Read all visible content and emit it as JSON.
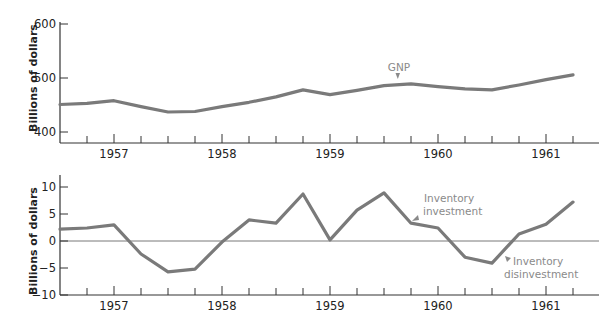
{
  "chart_data": [
    {
      "type": "line",
      "title": "",
      "xlabel": "",
      "ylabel": "Billions of dollars",
      "ylim": [
        380,
        600
      ],
      "yticks": [
        400,
        500,
        600
      ],
      "ytick_labels": [
        "400",
        "500",
        "600"
      ],
      "x_tick_labels": [
        "1957",
        "1958",
        "1959",
        "1960",
        "1961"
      ],
      "x_quarterly_ticks": true,
      "grid": false,
      "series": [
        {
          "name": "GNP",
          "color": "#7a7a7a",
          "x": [
            1956.5,
            1956.75,
            1957.0,
            1957.25,
            1957.5,
            1957.75,
            1958.0,
            1958.25,
            1958.5,
            1958.75,
            1959.0,
            1959.25,
            1959.5,
            1959.75,
            1960.0,
            1960.25,
            1960.5,
            1960.75,
            1961.0,
            1961.25
          ],
          "values": [
            451,
            453,
            458,
            447,
            437,
            438,
            447,
            455,
            465,
            478,
            469,
            477,
            486,
            489,
            484,
            480,
            478,
            487,
            497,
            506
          ]
        }
      ],
      "annotations": [
        {
          "text": "GNP",
          "x": 1959.65,
          "y": 489
        }
      ]
    },
    {
      "type": "line",
      "title": "",
      "xlabel": "",
      "ylabel": "Billions of dollars",
      "ylim": [
        -10,
        12
      ],
      "yticks": [
        -10,
        -5,
        0,
        5,
        10
      ],
      "ytick_labels": [
        "−10",
        "−5",
        "0",
        "5",
        "10"
      ],
      "x_tick_labels": [
        "1957",
        "1958",
        "1959",
        "1960",
        "1961"
      ],
      "x_quarterly_ticks": true,
      "zero_line": true,
      "grid": false,
      "series": [
        {
          "name": "Inventory investment",
          "color": "#7a7a7a",
          "x": [
            1956.5,
            1956.75,
            1957.0,
            1957.25,
            1957.5,
            1957.75,
            1958.0,
            1958.25,
            1958.5,
            1958.75,
            1959.0,
            1959.25,
            1959.5,
            1959.75,
            1960.0,
            1960.25,
            1960.5,
            1960.75,
            1961.0,
            1961.25
          ],
          "values": [
            2.2,
            2.4,
            3.0,
            -2.4,
            -5.7,
            -5.2,
            -0.2,
            3.9,
            3.3,
            8.7,
            0.2,
            5.7,
            8.9,
            3.3,
            2.4,
            -3.0,
            -4.1,
            1.3,
            3.1,
            7.2
          ]
        }
      ],
      "annotations": [
        {
          "text": "Inventory investment",
          "lines": [
            "Inventory",
            "investment"
          ],
          "x": 1959.8,
          "y": 3.3
        },
        {
          "text": "Inventory disinvestment",
          "lines": [
            "Inventory",
            "disinvestment"
          ],
          "x": 1960.7,
          "y": -3
        }
      ]
    }
  ],
  "labels": {
    "ylabel_top": "Billions of dollars",
    "ylabel_bottom": "Billions of dollars",
    "gnp": "GNP",
    "inv1": "Inventory",
    "inv2": "investment",
    "dis1": "Inventory",
    "dis2": "disinvestment"
  }
}
